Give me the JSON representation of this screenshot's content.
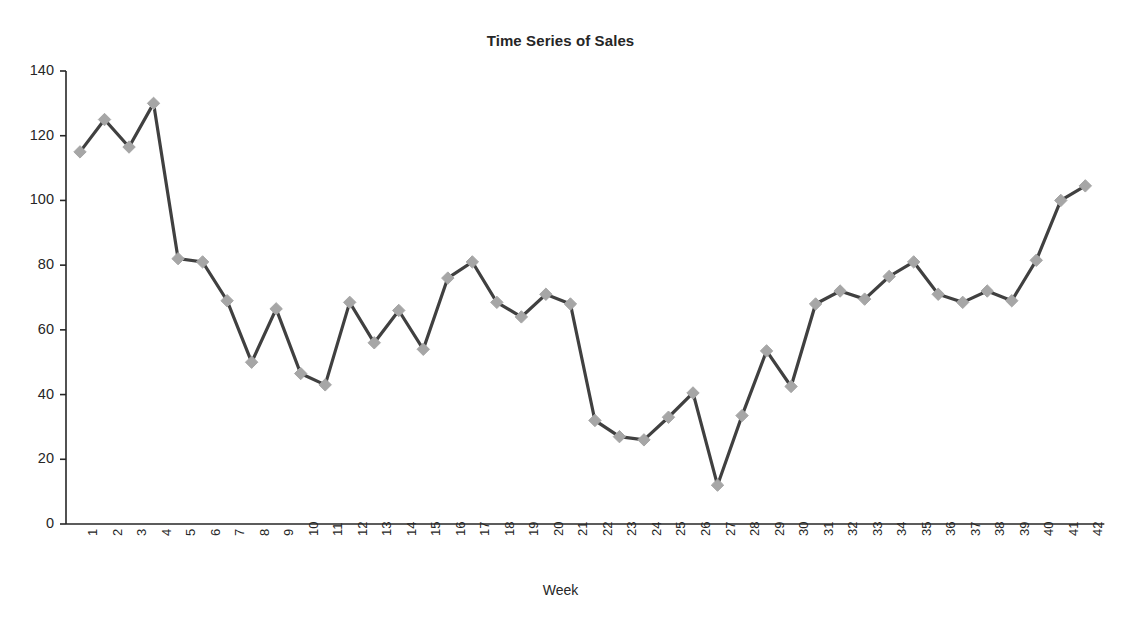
{
  "chart_data": {
    "type": "line",
    "title": "Time Series of Sales",
    "xlabel": "Week",
    "ylabel": "",
    "ylim": [
      0,
      140
    ],
    "ytick_step": 20,
    "yticks": [
      0,
      20,
      40,
      60,
      80,
      100,
      120,
      140
    ],
    "grid": false,
    "legend": null,
    "marker": "diamond",
    "marker_color": "#a6a6a6",
    "line_color": "#404040",
    "axis_color": "#262626",
    "categories": [
      1,
      2,
      3,
      4,
      5,
      6,
      7,
      8,
      9,
      10,
      11,
      12,
      13,
      14,
      15,
      16,
      17,
      18,
      19,
      20,
      21,
      22,
      23,
      24,
      25,
      26,
      27,
      28,
      29,
      30,
      31,
      32,
      33,
      34,
      35,
      36,
      37,
      38,
      39,
      40,
      41,
      42
    ],
    "xtick_labels": [
      "1",
      "2",
      "3",
      "4",
      "5",
      "6",
      "7",
      "8",
      "9",
      "10",
      "11",
      "12",
      "13",
      "14",
      "15",
      "16",
      "17",
      "18",
      "19",
      "20",
      "21",
      "22",
      "23",
      "24",
      "25",
      "26",
      "27",
      "28",
      "29",
      "30",
      "31",
      "32",
      "33",
      "34",
      "35",
      "36",
      "37",
      "38",
      "39",
      "40",
      "41",
      "42"
    ],
    "series": [
      {
        "name": "Sales",
        "values": [
          115,
          125,
          116.5,
          130,
          82,
          81,
          69,
          50,
          66.5,
          46.5,
          43,
          68.5,
          56,
          66,
          54,
          76,
          81,
          68.5,
          64,
          71,
          68,
          32,
          27,
          26,
          33,
          40.5,
          12,
          33.5,
          53.5,
          42.5,
          68,
          72,
          69.5,
          76.5,
          81,
          71,
          68.5,
          72,
          69,
          81.5,
          100,
          104.5
        ]
      }
    ]
  }
}
